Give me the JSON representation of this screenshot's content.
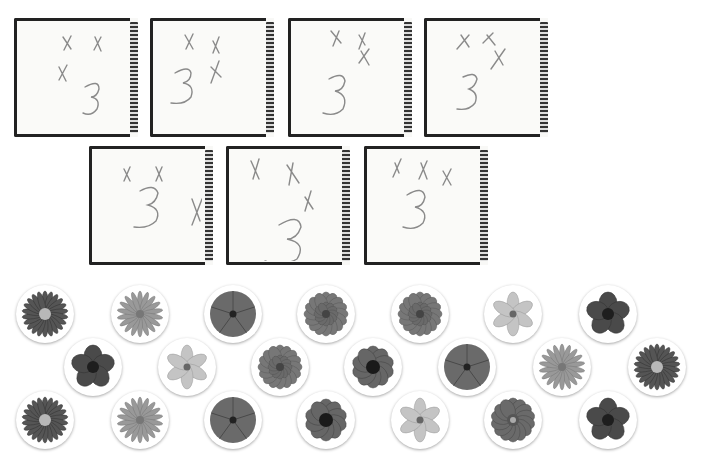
{
  "worksheet": {
    "cards": [
      {
        "id": 1,
        "x_marks": 3,
        "numeral": "3",
        "row": 1
      },
      {
        "id": 2,
        "x_marks": 3,
        "numeral": "3",
        "row": 1
      },
      {
        "id": 3,
        "x_marks": 3,
        "numeral": "3",
        "row": 1
      },
      {
        "id": 4,
        "x_marks": 3,
        "numeral": "3",
        "row": 1
      },
      {
        "id": 5,
        "x_marks": 3,
        "numeral": "3",
        "row": 2
      },
      {
        "id": 6,
        "x_marks": 3,
        "numeral": "3",
        "row": 2
      },
      {
        "id": 7,
        "x_marks": 3,
        "numeral": "3",
        "row": 2
      }
    ],
    "flower_rows": [
      [
        "gerbera",
        "daisy",
        "petunia",
        "zinnia",
        "zinnia",
        "lily",
        "primrose"
      ],
      [
        "primrose",
        "lily",
        "zinnia",
        "pansy",
        "petunia",
        "daisy",
        "gerbera"
      ],
      [
        "gerbera",
        "daisy",
        "petunia",
        "pansy",
        "lily",
        "dahlia",
        "primrose"
      ]
    ],
    "colors": {
      "ink": "#8a8a8a",
      "frame": "#222222",
      "paper": "#fafaf8"
    }
  }
}
